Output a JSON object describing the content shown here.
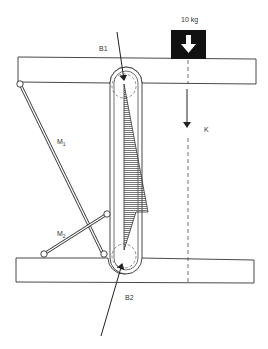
{
  "diagram": {
    "weight": {
      "label": "10 kg",
      "icon": "down-arrow-icon",
      "fill": "#111111"
    },
    "labels": {
      "top_force": "B1",
      "bottom_force": "B2",
      "line_of_action": "K",
      "member_1": "M",
      "member_1_sub": "1",
      "member_2": "M",
      "member_2_sub": "2"
    },
    "colors": {
      "stroke": "#333333",
      "hatch": "#555555",
      "background": "#ffffff"
    }
  }
}
